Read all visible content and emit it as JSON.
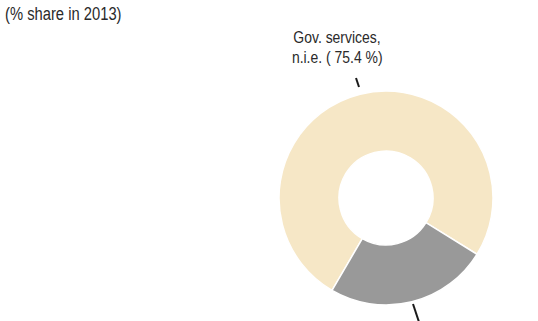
{
  "header": {
    "title_cropped": "",
    "subtitle": "(% share in 2013)"
  },
  "chart_data": {
    "type": "pie",
    "variant": "donut",
    "title": "",
    "subtitle": "(% share in 2013)",
    "slices": [
      {
        "name": "Gov. services, n.i.e.",
        "value": 75.4,
        "color": "#f6e7c6",
        "label_line1": "Gov. services,",
        "label_line2": "n.i.e. ( 75.4 %)",
        "label_visible": true
      },
      {
        "name": "Other",
        "value": 24.6,
        "color": "#999999",
        "label_visible": false
      }
    ],
    "legend": "none"
  },
  "colors": {
    "title": "#a5562a",
    "text": "#2a2a2a",
    "leader": "#1a1a1a",
    "separator": "#ffffff"
  }
}
